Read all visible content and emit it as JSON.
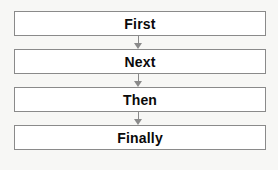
{
  "diagram": {
    "type": "sequential-flowchart",
    "orientation": "vertical",
    "background_color": "#f7f7f5",
    "box_fill_color": "#ffffff",
    "box_border_color": "#8a8a8a",
    "text_color": "#0a0a0a",
    "connector_color": "#8a8a8a",
    "steps": [
      {
        "label": "First"
      },
      {
        "label": "Next"
      },
      {
        "label": "Then"
      },
      {
        "label": "Finally"
      }
    ],
    "connectors": [
      {
        "name": "arrow-first-to-next",
        "direction": "down"
      },
      {
        "name": "arrow-next-to-then",
        "direction": "down"
      },
      {
        "name": "arrow-then-to-finally",
        "direction": "down"
      }
    ]
  }
}
